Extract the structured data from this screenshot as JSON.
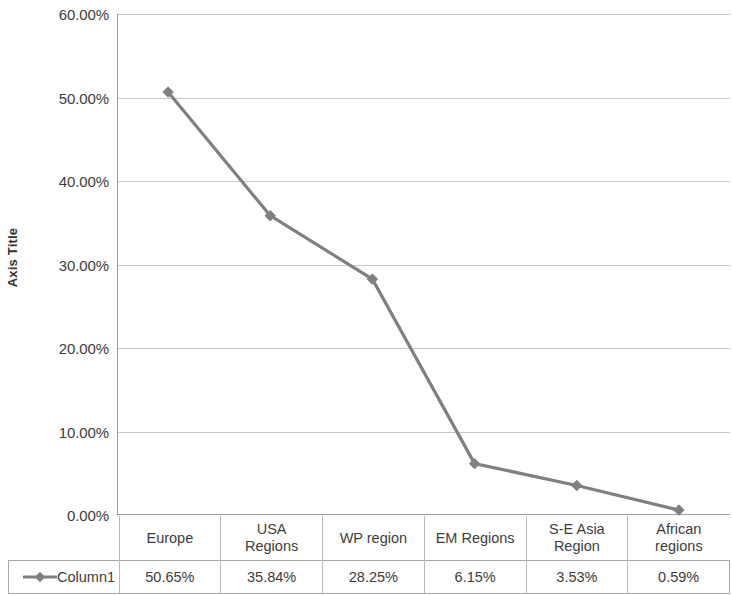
{
  "chart_data": {
    "type": "line",
    "title": "",
    "xlabel": "",
    "ylabel": "Axis Title",
    "categories": [
      "Europe",
      "USA Regions",
      "WP region",
      "EM Regions",
      "S-E Asia Region",
      "African regions"
    ],
    "category_lines": [
      [
        "Europe"
      ],
      [
        "USA",
        "Regions"
      ],
      [
        "WP region"
      ],
      [
        "EM Regions"
      ],
      [
        "S-E Asia",
        "Region"
      ],
      [
        "African",
        "regions"
      ]
    ],
    "series": [
      {
        "name": "Column1",
        "values": [
          50.65,
          35.84,
          28.25,
          6.15,
          3.53,
          0.59
        ],
        "value_labels": [
          "50.65%",
          "35.84%",
          "28.25%",
          "6.15%",
          "3.53%",
          "0.59%"
        ],
        "color": "#808080",
        "marker": "diamond"
      }
    ],
    "ylim": [
      0,
      60
    ],
    "ytick_values": [
      0,
      10,
      20,
      30,
      40,
      50,
      60
    ],
    "ytick_labels": [
      "0.00%",
      "10.00%",
      "20.00%",
      "30.00%",
      "40.00%",
      "50.00%",
      "60.00%"
    ],
    "grid": true,
    "grid_axis": "y",
    "legend_position": "data-table",
    "data_table_visible": true
  },
  "axis": {
    "y_title": "Axis Title"
  },
  "legend": {
    "series_label": "Column1"
  },
  "colors": {
    "series": "#808080",
    "gridline": "#c9c9c9",
    "axis": "#9b9b9b",
    "text": "#3d3d3d",
    "table_border": "#a8a8a8"
  }
}
